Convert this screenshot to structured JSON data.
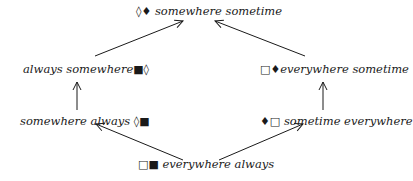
{
  "diagram": {
    "nodes": {
      "top": {
        "symbols": "◊♦",
        "label": "somewhere sometime"
      },
      "left_upper": {
        "label": "always somewhere",
        "symbols": "■◊"
      },
      "right_upper": {
        "symbols": "□♦",
        "label": "everywhere sometime"
      },
      "left_lower": {
        "label": "somewhere always",
        "symbols": "◊■"
      },
      "right_lower": {
        "symbols": "♦□",
        "label": "sometime everywhere"
      },
      "bottom": {
        "symbols": "□■",
        "label": "everywhere always"
      }
    },
    "edges": [
      {
        "from": "bottom",
        "to": "left_lower"
      },
      {
        "from": "bottom",
        "to": "right_lower"
      },
      {
        "from": "left_lower",
        "to": "left_upper"
      },
      {
        "from": "right_lower",
        "to": "right_upper"
      },
      {
        "from": "left_upper",
        "to": "top"
      },
      {
        "from": "right_upper",
        "to": "top"
      }
    ]
  }
}
